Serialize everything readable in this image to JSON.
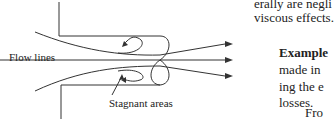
{
  "figure": {
    "labels": {
      "flow_lines": "Flow lines",
      "stagnant_areas": "Stagnant areas"
    },
    "icons": [
      "flow-arrow-icon",
      "recirculation-eddy-icon"
    ]
  },
  "text": {
    "line1": "erally are negli",
    "line2": "viscous effects.",
    "example_heading": "Example",
    "line4": "made in",
    "line5": "ing the e",
    "line6": "losses.",
    "line7": "Fro",
    "line8": "f  f"
  }
}
